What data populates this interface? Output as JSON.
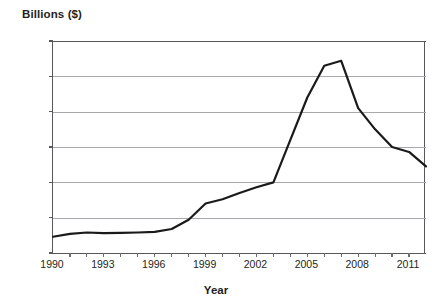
{
  "chart_data": {
    "type": "line",
    "title": "",
    "ylabel": "Billions ($)",
    "xlabel": "Year",
    "ylim": [
      0,
      3000
    ],
    "xlim": [
      1990,
      2012
    ],
    "grid": true,
    "legend": null,
    "ytick_labels": [
      "3,000",
      "2,500",
      "2,000",
      "1,500",
      "1,000",
      "500",
      "0"
    ],
    "ytick_values": [
      3000,
      2500,
      2000,
      1500,
      1000,
      500,
      0
    ],
    "xtick_values": [
      1990,
      1991,
      1992,
      1993,
      1994,
      1995,
      1996,
      1997,
      1998,
      1999,
      2000,
      2001,
      2002,
      2003,
      2004,
      2005,
      2006,
      2007,
      2008,
      2009,
      2010,
      2011,
      2012
    ],
    "xtick_labels_shown": [
      "1990",
      "1993",
      "1996",
      "1999",
      "2002",
      "2005",
      "2008",
      "2011"
    ],
    "series": [
      {
        "name": "",
        "color": "#1a1a1a",
        "x": [
          1990,
          1991,
          1992,
          1993,
          1994,
          1995,
          1996,
          1997,
          1998,
          1999,
          2000,
          2001,
          2002,
          2003,
          2004,
          2005,
          2006,
          2007,
          2008,
          2009,
          2010,
          2011,
          2012
        ],
        "values": [
          230,
          270,
          290,
          280,
          285,
          290,
          300,
          340,
          470,
          700,
          760,
          850,
          930,
          1000,
          1600,
          2200,
          2650,
          2720,
          2050,
          1750,
          1500,
          1430,
          1225
        ]
      }
    ]
  },
  "axis_color": "#58585a",
  "grid_color": "#a6a8ab",
  "line_color": "#1a1a1a"
}
